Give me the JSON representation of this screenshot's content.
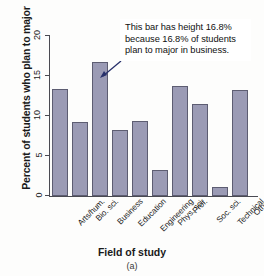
{
  "chart_data": {
    "type": "bar",
    "title": "",
    "subtitle": "",
    "xlabel": "Field of study",
    "ylabel": "Percent of students who plan to major",
    "categories": [
      "Arts/hum.",
      "Bio. sci.",
      "Business",
      "Education",
      "Engineering",
      "Phys. sci.",
      "Prof.",
      "Soc. sci.",
      "Technical",
      "Other"
    ],
    "values": [
      13.4,
      9.3,
      16.8,
      8.2,
      9.4,
      3.2,
      13.8,
      11.5,
      1.1,
      13.3
    ],
    "ylim": [
      0,
      20
    ],
    "yticks": [
      0,
      5,
      10,
      15,
      20
    ],
    "ytick_labels": [
      "0",
      "5",
      "10",
      "15",
      "20"
    ],
    "grid": false,
    "legend": false,
    "bar_color": "#9b9bb5",
    "bar_edge_color": "#5d5d72",
    "axis_color": "#4a4a52",
    "annotations": [
      {
        "name": "business-bar-callout",
        "text": "This bar has height 16.8% because 16.8% of students plan to major in business.",
        "target_category": "Business",
        "target_value": 16.8,
        "border_color": "#27306b"
      }
    ]
  },
  "figure": {
    "caption": "(a)"
  }
}
